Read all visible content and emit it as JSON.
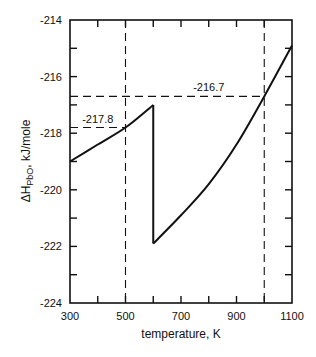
{
  "chart_data": {
    "type": "line",
    "title": "",
    "xlabel": "temperature, K",
    "ylabel": "ΔHPbO, kJ/mole",
    "ylabel_main": "ΔH",
    "ylabel_sub": "PbO",
    "ylabel_rest": ", kJ/mole",
    "xlim": [
      300,
      1100
    ],
    "ylim": [
      -224,
      -214
    ],
    "grid": false,
    "x_ticks": [
      300,
      500,
      700,
      900,
      1100
    ],
    "x_tick_labels": [
      "300",
      "500",
      "700",
      "900",
      "1100"
    ],
    "x_minor_ticks": [
      400,
      600,
      800,
      1000
    ],
    "y_ticks": [
      -214,
      -216,
      -218,
      -220,
      -222,
      -224
    ],
    "y_tick_labels": [
      "-214",
      "-216",
      "-218",
      "-220",
      "-222",
      "-224"
    ],
    "y_minor_ticks": [
      -215,
      -217,
      -219,
      -221,
      -223
    ],
    "series": [
      {
        "name": "segment 1 (below transition)",
        "x": [
          300,
          400,
          500,
          600
        ],
        "y": [
          -219.0,
          -218.4,
          -217.8,
          -217.0
        ]
      },
      {
        "name": "transition drop",
        "x": [
          600,
          600
        ],
        "y": [
          -217.0,
          -221.9
        ]
      },
      {
        "name": "segment 2 (above transition)",
        "x": [
          600,
          700,
          800,
          900,
          1000,
          1100
        ],
        "y": [
          -221.9,
          -220.9,
          -219.8,
          -218.4,
          -216.7,
          -214.9
        ]
      }
    ],
    "reference_lines": [
      {
        "type": "vertical",
        "x": 500,
        "style": "dashed"
      },
      {
        "type": "vertical",
        "x": 1000,
        "style": "dashed"
      },
      {
        "type": "horizontal",
        "y": -217.8,
        "x_range": [
          300,
          500
        ],
        "style": "dashed"
      },
      {
        "type": "horizontal",
        "y": -216.7,
        "x_range": [
          300,
          1000
        ],
        "style": "dashed"
      }
    ],
    "annotations": [
      {
        "text": "-217.8",
        "x": 400,
        "y": -217.8
      },
      {
        "text": "-216.7",
        "x": 800,
        "y": -216.7
      }
    ]
  }
}
